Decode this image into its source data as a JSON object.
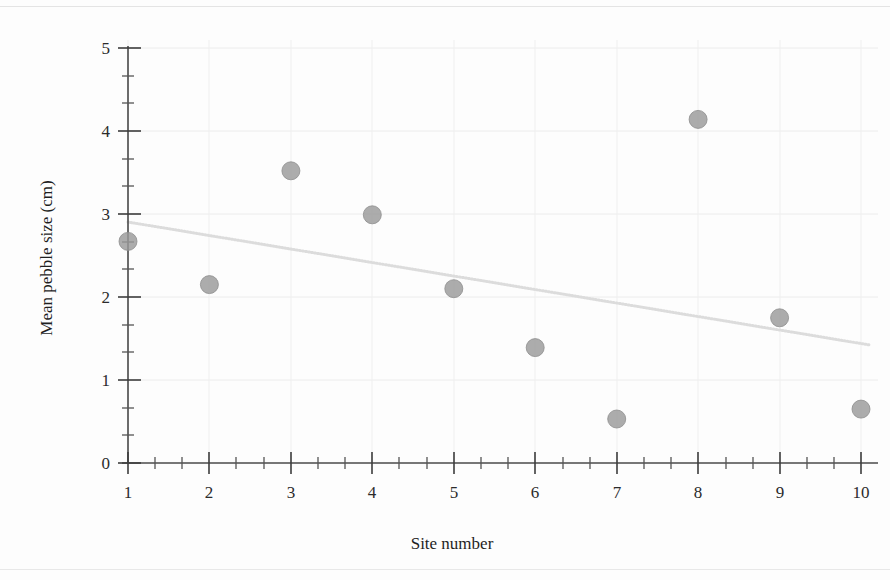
{
  "chart_data": {
    "type": "scatter",
    "title": "",
    "xlabel": "Site number",
    "ylabel": "Mean pebble size (cm)",
    "x": [
      1,
      2,
      3,
      4,
      5,
      6,
      7,
      8,
      9,
      10
    ],
    "values": [
      2.67,
      2.15,
      3.52,
      2.99,
      2.1,
      1.39,
      0.53,
      4.14,
      1.75,
      0.65
    ],
    "series": [
      {
        "name": "Mean pebble size",
        "values": [
          2.67,
          2.15,
          3.52,
          2.99,
          2.1,
          1.39,
          0.53,
          4.14,
          1.75,
          0.65
        ]
      }
    ],
    "xlim": [
      0.55,
      10.45
    ],
    "ylim": [
      0,
      5
    ],
    "xticks": [
      1,
      2,
      3,
      4,
      5,
      6,
      7,
      8,
      9,
      10
    ],
    "xtick_labels": [
      "1",
      "2",
      "3",
      "4",
      "5",
      "6",
      "7",
      "8",
      "9",
      "10"
    ],
    "yticks": [
      0,
      1,
      2,
      3,
      4,
      5
    ],
    "ytick_labels": [
      "0",
      "1",
      "2",
      "3",
      "4",
      "5"
    ],
    "y_minor_ticks_per_major": 2,
    "x_minor_ticks_per_major": 2,
    "grid": true,
    "grid_color": "#e9e9e9",
    "legend": "none",
    "marker_color": "#9a9a9a",
    "marker_shape": "circle",
    "marker_radius": 9,
    "trendline": {
      "show": true,
      "type": "linear",
      "x_start": 1,
      "y_start": 2.9,
      "x_end": 10.4,
      "y_end": 1.42,
      "color": "#d8d8d8",
      "style": "dotted"
    },
    "axis_color": "#4a4a4a"
  },
  "axis_labels": {
    "x_title": "Site number",
    "y_title": "Mean pebble size (cm)"
  },
  "y_ticks": {
    "t0": "0",
    "t1": "1",
    "t2": "2",
    "t3": "3",
    "t4": "4",
    "t5": "5"
  },
  "x_ticks": {
    "t1": "1",
    "t2": "2",
    "t3": "3",
    "t4": "4",
    "t5": "5",
    "t6": "6",
    "t7": "7",
    "t8": "8",
    "t9": "9",
    "t10": "10"
  }
}
